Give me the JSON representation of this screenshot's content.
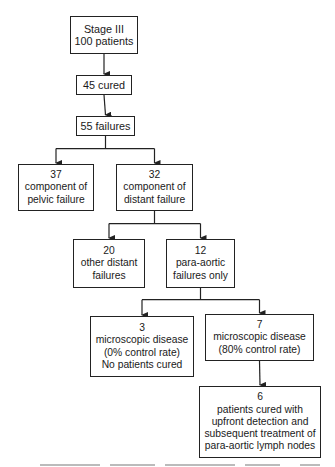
{
  "diagram": {
    "nodes": {
      "stage": {
        "lines": [
          "Stage III",
          "100 patients"
        ]
      },
      "cured": {
        "lines": [
          "45 cured"
        ]
      },
      "failures": {
        "lines": [
          "55 failures"
        ]
      },
      "pelvic": {
        "lines": [
          "37",
          "component of",
          "pelvic failure"
        ]
      },
      "distant": {
        "lines": [
          "32",
          "component of",
          "distant failure"
        ]
      },
      "other_distant": {
        "lines": [
          "20",
          "other distant",
          "failures"
        ]
      },
      "para_aortic": {
        "lines": [
          "12",
          "para-aortic",
          "failures only"
        ]
      },
      "micro_0": {
        "lines": [
          "3",
          "microscopic disease",
          "(0% control rate)",
          "No patients cured"
        ]
      },
      "micro_80": {
        "lines": [
          "7",
          "microscopic disease",
          "(80% control rate)"
        ]
      },
      "cured_upfront": {
        "lines": [
          "6",
          "patients cured with",
          "upfront detection and",
          "subsequent treatment of",
          "para-aortic lymph nodes"
        ]
      }
    },
    "edges": [
      {
        "from": "stage",
        "to": "cured"
      },
      {
        "from": "cured",
        "to": "failures"
      },
      {
        "from": "failures",
        "to": "pelvic"
      },
      {
        "from": "failures",
        "to": "distant"
      },
      {
        "from": "distant",
        "to": "other_distant"
      },
      {
        "from": "distant",
        "to": "para_aortic"
      },
      {
        "from": "para_aortic",
        "to": "micro_0"
      },
      {
        "from": "para_aortic",
        "to": "micro_80"
      },
      {
        "from": "micro_80",
        "to": "cured_upfront"
      }
    ],
    "colors": {
      "line": "#222222",
      "box_fill": "#ffffff",
      "text": "#1a1a1a"
    }
  }
}
